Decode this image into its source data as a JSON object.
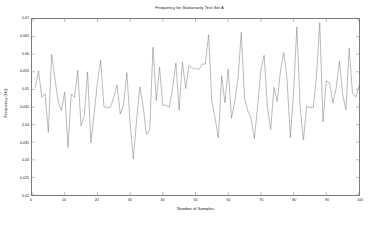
{
  "chart_data": {
    "type": "line",
    "title": "Frequency for Stationarity Test Set A",
    "xlabel": "Number of Samples",
    "ylabel": "Frequency (Hz)",
    "xlim": [
      0,
      100
    ],
    "ylim": [
      0.02,
      0.07
    ],
    "grid": false,
    "legend": null,
    "line_color": "#808080",
    "xticks": [
      0,
      10,
      20,
      30,
      40,
      50,
      60,
      70,
      80,
      90,
      100
    ],
    "xtick_labels": [
      "0",
      "10",
      "20",
      "30",
      "40",
      "50",
      "60",
      "70",
      "80",
      "90",
      "100"
    ],
    "yticks": [
      0.02,
      0.025,
      0.03,
      0.035,
      0.04,
      0.045,
      0.05,
      0.055,
      0.06,
      0.065,
      0.07
    ],
    "ytick_labels": [
      "0.02",
      "0.025",
      "0.03",
      "0.035",
      "0.04",
      "0.045",
      "0.05",
      "0.055",
      "0.06",
      "0.065",
      "0.07"
    ],
    "series": [
      {
        "name": "Set A",
        "x": [
          1,
          2,
          3,
          4,
          5,
          6,
          7,
          8,
          9,
          10,
          11,
          12,
          13,
          14,
          15,
          16,
          17,
          18,
          19,
          20,
          21,
          22,
          23,
          24,
          25,
          26,
          27,
          28,
          29,
          30,
          31,
          32,
          33,
          34,
          35,
          36,
          37,
          38,
          39,
          40,
          41,
          42,
          43,
          44,
          45,
          46,
          47,
          48,
          49,
          50,
          51,
          52,
          53,
          54,
          55,
          56,
          57,
          58,
          59,
          60,
          61,
          62,
          63,
          64,
          65,
          66,
          67,
          68,
          69,
          70,
          71,
          72,
          73,
          74,
          75,
          76,
          77,
          78,
          79,
          80,
          81,
          82,
          83,
          84,
          85,
          86,
          87,
          88,
          89,
          90,
          91,
          92,
          93,
          94,
          95,
          96,
          97,
          98,
          99,
          100
        ],
        "values": [
          0.0505,
          0.0553,
          0.0478,
          0.0488,
          0.0378,
          0.06,
          0.0532,
          0.0466,
          0.044,
          0.0492,
          0.0335,
          0.0487,
          0.0477,
          0.0554,
          0.0396,
          0.0426,
          0.055,
          0.0348,
          0.0432,
          0.0518,
          0.0584,
          0.0451,
          0.0448,
          0.045,
          0.0477,
          0.0513,
          0.043,
          0.0456,
          0.0548,
          0.0404,
          0.0302,
          0.0414,
          0.0507,
          0.0452,
          0.0372,
          0.0385,
          0.062,
          0.0468,
          0.0563,
          0.0454,
          0.0456,
          0.0449,
          0.0504,
          0.0575,
          0.0441,
          0.0578,
          0.0502,
          0.0568,
          0.056,
          0.056,
          0.0556,
          0.0572,
          0.0572,
          0.0655,
          0.0466,
          0.0418,
          0.0362,
          0.0539,
          0.0462,
          0.0558,
          0.0418,
          0.0466,
          0.053,
          0.0662,
          0.0475,
          0.044,
          0.0418,
          0.036,
          0.0452,
          0.0555,
          0.0597,
          0.0448,
          0.0386,
          0.0506,
          0.0466,
          0.0554,
          0.0605,
          0.0528,
          0.0363,
          0.0493,
          0.0678,
          0.045,
          0.0356,
          0.0452,
          0.0449,
          0.0448,
          0.0538,
          0.069,
          0.0408,
          0.0525,
          0.0518,
          0.0461,
          0.0503,
          0.058,
          0.0486,
          0.0442,
          0.0617,
          0.049,
          0.0478,
          0.051
        ]
      }
    ]
  }
}
